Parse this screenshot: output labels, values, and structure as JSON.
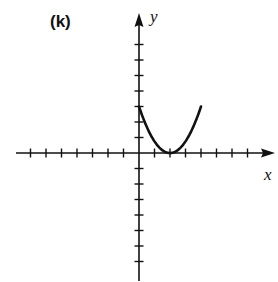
{
  "panel_label": "(k)",
  "chart_data": {
    "type": "line",
    "title": "(k)",
    "xlabel": "x",
    "ylabel": "y",
    "xlim": [
      -7,
      7
    ],
    "ylim": [
      -7,
      7
    ],
    "tick_spacing": 1,
    "tick_labels": false,
    "grid": false,
    "legend": null,
    "series": [
      {
        "name": "parabola",
        "equation": "y = 0.75(x - 2)^2",
        "x": [
          0,
          0.5,
          1,
          1.5,
          2,
          2.5,
          3,
          3.5,
          4
        ],
        "y": [
          3,
          1.69,
          0.75,
          0.19,
          0,
          0.19,
          0.75,
          1.69,
          3
        ]
      }
    ],
    "annotations": []
  },
  "colors": {
    "ink": "#111111",
    "background": "#ffffff"
  }
}
